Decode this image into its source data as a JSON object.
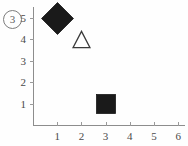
{
  "panel": {
    "label": "3",
    "label_display": "③"
  },
  "chart_data": {
    "type": "scatter",
    "title": "",
    "subtitle": "",
    "xlabel": "",
    "ylabel": "",
    "panel_label": "3",
    "xlim": [
      0,
      6.4
    ],
    "ylim": [
      0,
      5.45
    ],
    "grid": false,
    "legend": null,
    "x_ticks": [
      1,
      2,
      3,
      4,
      5,
      6
    ],
    "x_tick_labels": [
      "1",
      "2",
      "3",
      "4",
      "5",
      "6"
    ],
    "y_ticks": [
      1,
      2,
      3,
      4,
      5
    ],
    "y_tick_labels": [
      "1",
      "2",
      "3",
      "4",
      "5"
    ],
    "points": [
      {
        "name": "diamond-point",
        "x": 1,
        "y": 5,
        "marker": "diamond",
        "fill": "#1a1a1a",
        "stroke": "#1a1a1a",
        "filled": true,
        "size": 33
      },
      {
        "name": "triangle-point",
        "x": 2,
        "y": 4,
        "marker": "triangle",
        "fill": "#ffffff",
        "stroke": "#3b3b3b",
        "filled": false,
        "size": 19
      },
      {
        "name": "square-point",
        "x": 3,
        "y": 1,
        "marker": "square",
        "fill": "#1a1a1a",
        "stroke": "#1a1a1a",
        "filled": true,
        "size": 20
      }
    ],
    "colors": {
      "axis": "#8d8d8d",
      "tick": "#9a9a9a",
      "text": "#4a4a4a",
      "marker_fill": "#1a1a1a",
      "background": "#fefefe"
    }
  },
  "axes": {
    "x_tick_labels": [
      "1",
      "2",
      "3",
      "4",
      "5",
      "6"
    ],
    "y_tick_labels": [
      "1",
      "2",
      "3",
      "4",
      "5"
    ]
  }
}
